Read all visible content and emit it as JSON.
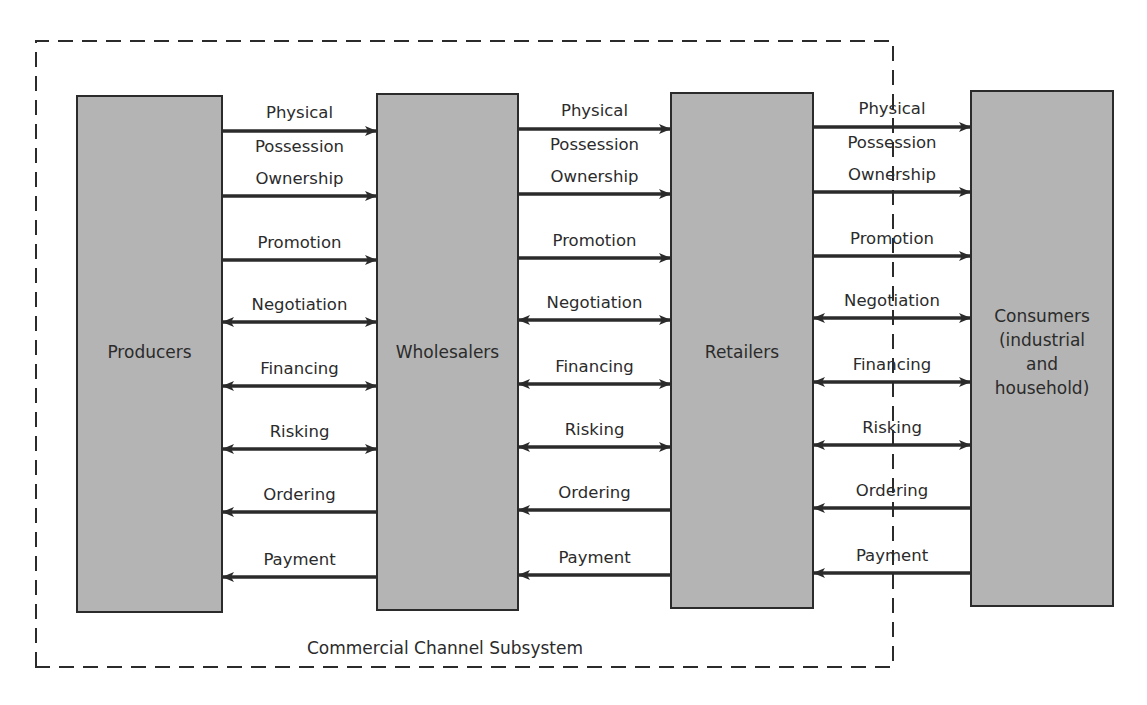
{
  "diagram": {
    "subsystem": {
      "label": "Commercial Channel Subsystem",
      "boundary": {
        "left": 36,
        "top": 41,
        "right": 893,
        "bottom": 667
      }
    },
    "colors": {
      "box_fill": "#b4b4b4",
      "stroke": "#2b2b2b",
      "background": "#ffffff"
    },
    "entities": [
      {
        "id": "producers",
        "lines": [
          "Producers"
        ],
        "x": 77,
        "y": 96,
        "w": 145,
        "h": 516
      },
      {
        "id": "wholesalers",
        "lines": [
          "Wholesalers"
        ],
        "x": 377,
        "y": 94,
        "w": 141,
        "h": 516
      },
      {
        "id": "retailers",
        "lines": [
          "Retailers"
        ],
        "x": 671,
        "y": 93,
        "w": 142,
        "h": 515
      },
      {
        "id": "consumers",
        "lines": [
          "Consumers",
          "(industrial",
          "and",
          "household)"
        ],
        "x": 971,
        "y": 91,
        "w": 142,
        "h": 515
      }
    ],
    "flows": [
      {
        "id": "physical-possession",
        "label_lines": [
          "Physical",
          "Possession"
        ],
        "direction": "forward",
        "label_position": "split"
      },
      {
        "id": "ownership",
        "label_lines": [
          "Ownership"
        ],
        "direction": "forward"
      },
      {
        "id": "promotion",
        "label_lines": [
          "Promotion"
        ],
        "direction": "forward"
      },
      {
        "id": "negotiation",
        "label_lines": [
          "Negotiation"
        ],
        "direction": "both"
      },
      {
        "id": "financing",
        "label_lines": [
          "Financing"
        ],
        "direction": "both"
      },
      {
        "id": "risking",
        "label_lines": [
          "Risking"
        ],
        "direction": "both"
      },
      {
        "id": "ordering",
        "label_lines": [
          "Ordering"
        ],
        "direction": "backward"
      },
      {
        "id": "payment",
        "label_lines": [
          "Payment"
        ],
        "direction": "backward"
      }
    ],
    "flow_y_base": [
      131,
      196,
      260,
      322,
      386,
      449,
      512,
      577
    ],
    "gap_y_offset": [
      0,
      -2,
      -4
    ]
  }
}
